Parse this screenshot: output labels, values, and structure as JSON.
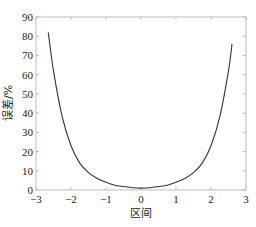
{
  "chart_data": {
    "type": "line",
    "title": "",
    "xlabel": "区间",
    "ylabel": "误差/%",
    "xlim": [
      -3,
      3
    ],
    "ylim": [
      0,
      90
    ],
    "xticks": [
      -3,
      -2,
      -1,
      0,
      1,
      2,
      3
    ],
    "yticks": [
      0,
      10,
      20,
      30,
      40,
      50,
      60,
      70,
      80,
      90
    ],
    "grid": false,
    "legend": null,
    "line_color": "#333333",
    "series": [
      {
        "name": "误差",
        "x": [
          -2.65,
          -2.5,
          -2.25,
          -2.0,
          -1.75,
          -1.5,
          -1.25,
          -1.0,
          -0.75,
          -0.5,
          -0.25,
          0.0,
          0.25,
          0.5,
          0.75,
          1.0,
          1.25,
          1.5,
          1.75,
          2.0,
          2.25,
          2.5,
          2.6
        ],
        "y": [
          82,
          62,
          38,
          23,
          14,
          9,
          6,
          4,
          2.5,
          1.8,
          1.2,
          1,
          1.2,
          1.8,
          2.5,
          4,
          6,
          9,
          14,
          23,
          38,
          62,
          76
        ]
      }
    ]
  }
}
